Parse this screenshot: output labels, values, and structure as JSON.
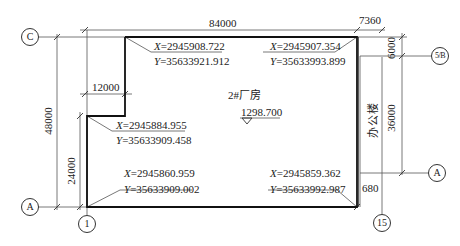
{
  "drawing": {
    "building_label": "2#厂房",
    "elevation": "1298.700",
    "office_label": "办公楼",
    "dimensions": {
      "overall_width": "84000",
      "right_offset": "7360",
      "notch_width": "12000",
      "overall_depth": "48000",
      "lower_depth": "24000",
      "office_top_offset": "6000",
      "office_length": "36000",
      "corner_offset": "680"
    },
    "axes": {
      "C": "C",
      "A_left": "A",
      "A_right": "A",
      "B5": "5/B",
      "one": "1",
      "fifteen": "15"
    },
    "coordinates": [
      {
        "name": "top-left-corner",
        "x_label": "X",
        "x_value": "=2945908.722",
        "y_label": "Y",
        "y_value": "=35633921.912"
      },
      {
        "name": "top-right-corner",
        "x_label": "X",
        "x_value": "=2945907.354",
        "y_label": "Y",
        "y_value": "=35633993.899"
      },
      {
        "name": "notch-corner",
        "x_label": "X",
        "x_value": "=2945884.955",
        "y_label": "Y",
        "y_value": "=35633909.458"
      },
      {
        "name": "bottom-left-corner",
        "x_label": "X",
        "x_value": "=2945860.959",
        "y_label": "Y",
        "y_value": "=35633909.002"
      },
      {
        "name": "bottom-right-corner",
        "x_label": "X",
        "x_value": "=2945859.362",
        "y_label": "Y",
        "y_value": "=35633992.987"
      }
    ]
  }
}
